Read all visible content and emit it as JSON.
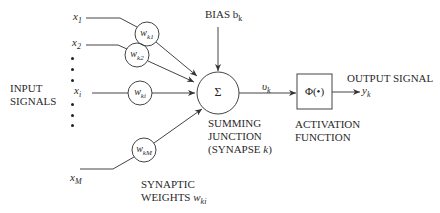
{
  "diagram": {
    "inputs": {
      "group_label_line1": "INPUT",
      "group_label_line2": "SIGNALS",
      "items": [
        {
          "name": "x",
          "sub": "1"
        },
        {
          "name": "x",
          "sub": "2"
        },
        {
          "name": "x",
          "sub": "i"
        },
        {
          "name": "x",
          "sub": "M"
        }
      ]
    },
    "weights": {
      "group_label_line1": "SYNAPTIC",
      "group_label_line2": "WEIGHTS",
      "group_symbol": "w",
      "group_symbol_sub": "ki",
      "items": [
        {
          "name": "w",
          "sub": "k1"
        },
        {
          "name": "w",
          "sub": "k2"
        },
        {
          "name": "w",
          "sub": "ki"
        },
        {
          "name": "w",
          "sub": "kM"
        }
      ]
    },
    "bias": {
      "label": "BIAS b",
      "sub": "k"
    },
    "summing_junction": {
      "symbol": "Σ",
      "label_line1": "SUMMING",
      "label_line2": "JUNCTION",
      "label_line3": "(SYNAPSE ",
      "label_line3_var": "k",
      "label_line3_end": ")"
    },
    "induced_field": {
      "name": "υ",
      "sub": "k"
    },
    "activation": {
      "symbol": "Φ(•)",
      "label_line1": "ACTIVATION",
      "label_line2": "FUNCTION"
    },
    "output": {
      "label": "OUTPUT SIGNAL",
      "name": "y",
      "sub": "k"
    },
    "colors": {
      "stroke": "#333333",
      "background": "#ffffff"
    }
  }
}
